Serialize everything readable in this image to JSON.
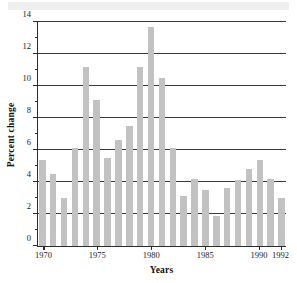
{
  "chart_data": {
    "type": "bar",
    "title": "",
    "xlabel": "Years",
    "ylabel": "Percent change",
    "categories": [
      1970,
      1971,
      1972,
      1973,
      1974,
      1975,
      1976,
      1977,
      1978,
      1979,
      1980,
      1981,
      1982,
      1983,
      1984,
      1985,
      1986,
      1987,
      1988,
      1989,
      1990,
      1991,
      1992
    ],
    "values": [
      5.4,
      4.5,
      3.0,
      6.1,
      11.2,
      9.1,
      5.5,
      6.6,
      7.5,
      11.2,
      13.7,
      10.5,
      6.1,
      3.1,
      4.2,
      3.5,
      1.9,
      3.6,
      4.1,
      4.8,
      5.4,
      4.2,
      3.0
    ],
    "ylim": [
      0,
      14
    ],
    "xlim": [
      1969.5,
      1992.5
    ],
    "ytick_major": [
      0,
      2,
      4,
      6,
      8,
      10,
      12,
      14
    ],
    "ytick_major_labels": [
      "0",
      "2",
      "4",
      "6",
      "8",
      "10",
      "12",
      "14"
    ],
    "ytick_minor": [
      1,
      3,
      5,
      7,
      9,
      11,
      13
    ],
    "xtick_values": [
      1970,
      1975,
      1980,
      1985,
      1990,
      1992
    ],
    "xtick_labels": [
      "1970",
      "1975",
      "1980",
      "1985",
      "1990",
      "1992"
    ],
    "grid": "horizontal-major",
    "legend": "none",
    "bar_color": "#c2c2c2",
    "axis_color": "#2b2b2b",
    "grid_color": "#3a3a3a"
  }
}
